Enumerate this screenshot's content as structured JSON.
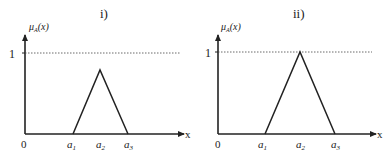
{
  "panels": [
    {
      "title": "i)",
      "y_label": "μ",
      "y_label_sub": "A",
      "y_label_arg": "(x)",
      "x_label": "x",
      "origin_label": "0",
      "one_label": "1",
      "ticks": [
        {
          "base": "a",
          "sub": "1"
        },
        {
          "base": "a",
          "sub": "2"
        },
        {
          "base": "a",
          "sub": "3"
        }
      ],
      "peak_membership": 0.8
    },
    {
      "title": "ii)",
      "y_label": "μ",
      "y_label_sub": "A",
      "y_label_arg": "(x)",
      "x_label": "x",
      "origin_label": "0",
      "one_label": "1",
      "ticks": [
        {
          "base": "a",
          "sub": "1"
        },
        {
          "base": "a",
          "sub": "2"
        },
        {
          "base": "a",
          "sub": "3"
        }
      ],
      "peak_membership": 1.0
    }
  ]
}
